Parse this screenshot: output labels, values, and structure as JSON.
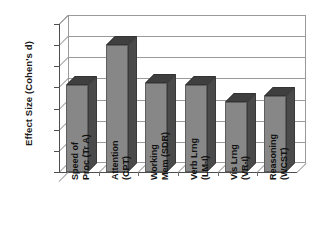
{
  "chart_data": {
    "type": "bar",
    "title": "",
    "xlabel": "",
    "ylabel": "Effect Size (Cohen's d)",
    "ylim": [
      0,
      0.7
    ],
    "ytick_labels": [
      "0.7",
      "0.6",
      "0.5",
      "0.4",
      "0.3",
      "0.2",
      "0.1",
      "0"
    ],
    "ytick_values": [
      0.7,
      0.6,
      0.5,
      0.4,
      0.3,
      0.2,
      0.1,
      0
    ],
    "grid": true,
    "legend": "none",
    "style": "3d-column",
    "categories": [
      "Speed of Proc (Tr A)",
      "Attention (CPT)",
      "Working Mem (SDR)",
      "Verb Lrng (LM-I)",
      "Vis Lrng (VR-I)",
      "Reasoning (WCST)"
    ],
    "category_lines": [
      [
        "Speed of",
        "Proc (Tr A)"
      ],
      [
        "Attention",
        "(CPT)"
      ],
      [
        "Working",
        "Mem (SDR)"
      ],
      [
        "Verb Lrng",
        "(LM-I)"
      ],
      [
        "Vis Lrng",
        "(VR-I)"
      ],
      [
        "Reasoning",
        "(WCST)"
      ]
    ],
    "values": [
      0.41,
      0.6,
      0.42,
      0.41,
      0.33,
      0.36
    ],
    "colors": {
      "bar_front": "#878787",
      "bar_side": "#4a4a4a",
      "bar_top": "#3f3f3f",
      "grid": "#9a9a9a",
      "axis": "#4d4d4d",
      "text": "#111111",
      "background": "#ffffff"
    }
  }
}
